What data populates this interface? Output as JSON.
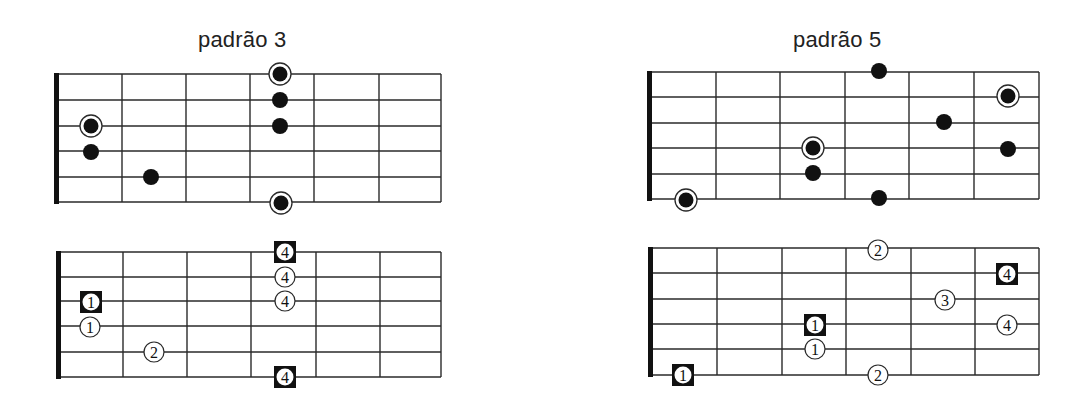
{
  "titles": [
    {
      "text": "padrão 3",
      "x": 198,
      "y": 27
    },
    {
      "text": "padrão 5",
      "x": 793,
      "y": 27
    }
  ],
  "colors": {
    "line": "#2a2a2a",
    "dot": "#111111",
    "background": "#ffffff"
  },
  "diagrams": [
    {
      "name": "pattern-3-dots",
      "nut_x": 54,
      "frets_x": [
        122,
        186,
        250,
        314,
        379,
        441
      ],
      "strings_y": [
        74,
        100,
        126,
        151,
        177,
        202
      ],
      "markers": [
        {
          "type": "root",
          "x": 91,
          "y": 126
        },
        {
          "type": "dot",
          "x": 91,
          "y": 152
        },
        {
          "type": "dot",
          "x": 151,
          "y": 177
        },
        {
          "type": "root",
          "x": 280,
          "y": 74
        },
        {
          "type": "dot",
          "x": 280,
          "y": 100
        },
        {
          "type": "dot",
          "x": 280,
          "y": 126
        },
        {
          "type": "root",
          "x": 281,
          "y": 203
        }
      ]
    },
    {
      "name": "pattern-3-fingers",
      "nut_x": 56,
      "frets_x": [
        123,
        187,
        251,
        316,
        380,
        441
      ],
      "strings_y": [
        252,
        277,
        301,
        326,
        352,
        377
      ],
      "markers": [
        {
          "type": "square",
          "label": "4",
          "x": 285,
          "y": 252
        },
        {
          "type": "circle",
          "label": "4",
          "x": 285,
          "y": 277
        },
        {
          "type": "circle",
          "label": "4",
          "x": 285,
          "y": 301
        },
        {
          "type": "square",
          "label": "1",
          "x": 91,
          "y": 302
        },
        {
          "type": "circle",
          "label": "1",
          "x": 90,
          "y": 327
        },
        {
          "type": "circle",
          "label": "2",
          "x": 154,
          "y": 352
        },
        {
          "type": "square",
          "label": "4",
          "x": 285,
          "y": 377
        }
      ]
    },
    {
      "name": "pattern-5-dots",
      "nut_x": 647,
      "frets_x": [
        716,
        780,
        845,
        909,
        974,
        1039
      ],
      "strings_y": [
        72,
        97,
        123,
        148,
        174,
        199
      ],
      "markers": [
        {
          "type": "dot",
          "x": 879,
          "y": 71
        },
        {
          "type": "root",
          "x": 1008,
          "y": 96
        },
        {
          "type": "dot",
          "x": 944,
          "y": 122
        },
        {
          "type": "root",
          "x": 813,
          "y": 148
        },
        {
          "type": "dot",
          "x": 1008,
          "y": 149
        },
        {
          "type": "dot",
          "x": 813,
          "y": 173
        },
        {
          "type": "root",
          "x": 686,
          "y": 200
        },
        {
          "type": "dot",
          "x": 879,
          "y": 198
        }
      ]
    },
    {
      "name": "pattern-5-fingers",
      "nut_x": 648,
      "frets_x": [
        717,
        782,
        846,
        911,
        975,
        1039
      ],
      "strings_y": [
        248,
        273,
        299,
        324,
        349,
        375
      ],
      "markers": [
        {
          "type": "circle",
          "label": "2",
          "x": 878,
          "y": 250
        },
        {
          "type": "square",
          "label": "4",
          "x": 1007,
          "y": 274
        },
        {
          "type": "circle",
          "label": "3",
          "x": 945,
          "y": 300
        },
        {
          "type": "square",
          "label": "1",
          "x": 815,
          "y": 325
        },
        {
          "type": "circle",
          "label": "4",
          "x": 1007,
          "y": 325
        },
        {
          "type": "circle",
          "label": "1",
          "x": 815,
          "y": 349
        },
        {
          "type": "square",
          "label": "1",
          "x": 683,
          "y": 375
        },
        {
          "type": "circle",
          "label": "2",
          "x": 878,
          "y": 375
        }
      ]
    }
  ]
}
